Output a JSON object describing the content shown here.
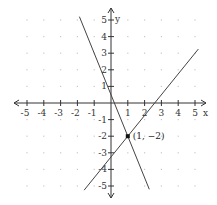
{
  "chart_data": {
    "type": "line",
    "title": "",
    "xlabel": "x",
    "ylabel": "y",
    "xlim": [
      -5,
      5
    ],
    "ylim": [
      -5,
      5
    ],
    "grid": "dots",
    "x_ticks": [
      -5,
      -4,
      -3,
      -2,
      -1,
      1,
      2,
      3,
      4,
      5
    ],
    "y_ticks": [
      -5,
      -4,
      -3,
      -2,
      -1,
      1,
      2,
      3,
      4,
      5
    ],
    "series": [
      {
        "name": "line-1",
        "slope": -2.5,
        "intercept": 0.5,
        "x_range": [
          -1.88,
          2.28
        ]
      },
      {
        "name": "line-2",
        "slope": 1.25,
        "intercept": -3.25,
        "x_range": [
          -1.6,
          5.2
        ]
      }
    ],
    "points": [
      {
        "x": 1,
        "y": -2,
        "label": "(1, −2)"
      }
    ]
  },
  "axes": {
    "x_label": "x",
    "y_label": "y"
  },
  "colors": {
    "axis": "#333333",
    "line": "#444444",
    "grid_dot": "#c8c8c8",
    "point": "#111111"
  }
}
